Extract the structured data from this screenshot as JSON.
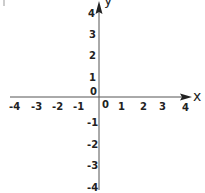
{
  "diagram": {
    "type": "coordinate-plane",
    "x_axis": {
      "label": "x",
      "ticks": [
        "-4",
        "-3",
        "-2",
        "-1",
        "0",
        "1",
        "2",
        "3",
        "4"
      ],
      "range": [
        -4,
        4
      ]
    },
    "y_axis": {
      "label": "y",
      "ticks_positive": [
        "4",
        "3",
        "2",
        "1"
      ],
      "origin_label": "0",
      "ticks_negative": [
        "-1",
        "-2",
        "-3",
        "-4"
      ],
      "range": [
        -4,
        4
      ]
    },
    "colors": {
      "axis": "#555555",
      "text": "#222222",
      "background": "#ffffff"
    }
  }
}
